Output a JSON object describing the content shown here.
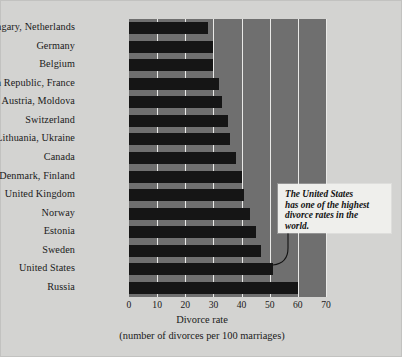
{
  "chart_data": {
    "type": "bar",
    "orientation": "horizontal",
    "title": "",
    "xlabel": "Divorce rate",
    "xlabel_sub": "(number of divorces per 100 marriages)",
    "ylabel": "",
    "xlim": [
      0,
      70
    ],
    "xticks": [
      0,
      10,
      20,
      30,
      40,
      50,
      60,
      70
    ],
    "grid": true,
    "grid_axis": "x",
    "legend": false,
    "categories": [
      "Hungary, Netherlands",
      "Germany",
      "Belgium",
      "Czech Republic, France",
      "Austria, Moldova",
      "Switzerland",
      "Lithuania, Ukraine",
      "Canada",
      "Denmark, Finland",
      "United Kingdom",
      "Norway",
      "Estonia",
      "Sweden",
      "United States",
      "Russia"
    ],
    "values": [
      28,
      30,
      30,
      32,
      33,
      35,
      36,
      38,
      40,
      41,
      43,
      45,
      47,
      51,
      60
    ],
    "annotations": [
      {
        "text": "The United States has one of the highest divorce rates in the world.",
        "target_category": "United States"
      }
    ]
  },
  "callout": {
    "line1": "The United States",
    "line2": "has one of the highest",
    "line3": "divorce rates in the",
    "line4": "world."
  },
  "colors": {
    "page_background": "#d3d3d1",
    "plot_background": "#6f6f6f",
    "bar": "#151515",
    "gridline": "#e9e9e7",
    "callout_background": "#efefec",
    "text": "#1a1a1a"
  }
}
